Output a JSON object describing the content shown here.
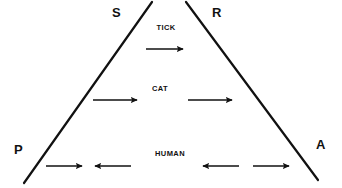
{
  "figure": {
    "background_color": "#ffffff",
    "line_color": "#111111",
    "text_color": "#111111"
  },
  "triangle": {
    "name": "open-apex-triangle",
    "left_leg": {
      "x1": 152,
      "y1": 2,
      "x2": 24,
      "y2": 183
    },
    "right_leg": {
      "x1": 186,
      "y1": 2,
      "x2": 318,
      "y2": 180
    }
  },
  "corners": [
    {
      "id": "S",
      "label": "S",
      "position": "top-left",
      "x": 112,
      "y": 6
    },
    {
      "id": "R",
      "label": "R",
      "position": "top-right",
      "x": 212,
      "y": 6
    },
    {
      "id": "P",
      "label": "P",
      "position": "bottom-left",
      "x": 14,
      "y": 143
    },
    {
      "id": "A",
      "label": "A",
      "position": "bottom-right",
      "x": 316,
      "y": 138
    }
  ],
  "tiers": [
    {
      "id": "tick",
      "label": "TICK",
      "label_x": 166,
      "label_y": 24,
      "arrow_y": 49,
      "arrows": [
        {
          "direction": "right",
          "x": 146,
          "width": 37
        }
      ]
    },
    {
      "id": "cat",
      "label": "CAT",
      "label_x": 160,
      "label_y": 85,
      "arrow_y": 100,
      "arrows": [
        {
          "direction": "right",
          "x": 93,
          "width": 44
        },
        {
          "direction": "right",
          "x": 188,
          "width": 44
        }
      ]
    },
    {
      "id": "human",
      "label": "HUMAN",
      "label_x": 170,
      "label_y": 150,
      "arrow_y": 166,
      "arrows": [
        {
          "direction": "right",
          "x": 46,
          "width": 36
        },
        {
          "direction": "left",
          "x": 95,
          "width": 36
        },
        {
          "direction": "left",
          "x": 203,
          "width": 36
        },
        {
          "direction": "right",
          "x": 253,
          "width": 36
        }
      ]
    }
  ]
}
